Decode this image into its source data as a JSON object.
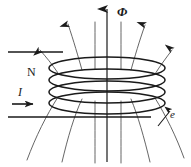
{
  "figure": {
    "width": 191,
    "height": 167,
    "background_color": "#ffffff",
    "stroke_color": "#1a1a1a",
    "fieldline_color": "#4a4a4a"
  },
  "labels": {
    "flux": "Φ",
    "turns": "N",
    "current": "I",
    "emf": "e"
  },
  "elements": {
    "axis_name": "flux-axis-arrow",
    "coil_name": "coil-windings",
    "coil_turn_count": 4,
    "lead_top_name": "wire-lead-top",
    "lead_bottom_name": "wire-lead-bottom",
    "current_arrow_name": "current-direction-arrow",
    "emf_arrow_name": "emf-pointer-arrow",
    "fieldline_count": 10,
    "arrowhead_fieldline_count": 4
  },
  "geometry": {
    "axis_x": 107,
    "axis_top_y": 8,
    "axis_bottom_y": 162,
    "coil_center_x": 107,
    "coil_rx": 58,
    "coil_ry": 11,
    "coil_turn_y": [
      68,
      80,
      92,
      103
    ],
    "lead_top_y": 52,
    "lead_top_x1": 8,
    "lead_top_x2": 62,
    "lead_bottom_y": 117,
    "lead_bottom_x1": 8,
    "lead_bottom_x2": 150
  }
}
